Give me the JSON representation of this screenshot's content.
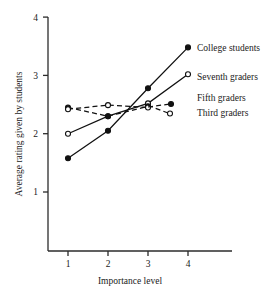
{
  "chart_data": {
    "type": "line",
    "title": "",
    "xlabel": "Importance level",
    "ylabel": "Average rating given by students",
    "x": [
      1,
      2,
      3,
      4
    ],
    "xtick_labels": [
      "1",
      "2",
      "3",
      "4"
    ],
    "ytick_labels": [
      "1",
      "2",
      "3",
      "4"
    ],
    "xlim": [
      0.55,
      4.6
    ],
    "ylim": [
      0.35,
      4.15
    ],
    "grid": false,
    "legend_position": "right-inline",
    "series": [
      {
        "name": "College students",
        "x": [
          1,
          2,
          3,
          4
        ],
        "values": [
          1.58,
          2.05,
          2.78,
          3.48
        ],
        "line_style": "solid",
        "marker": "filled-circle",
        "color": "#111111"
      },
      {
        "name": "Seventh graders",
        "x": [
          1,
          2,
          3,
          4
        ],
        "values": [
          2.0,
          2.3,
          2.52,
          3.02
        ],
        "line_style": "solid",
        "marker": "open-circle",
        "color": "#111111"
      },
      {
        "name": "Fifth graders",
        "x": [
          1,
          2,
          3
        ],
        "values": [
          2.45,
          2.3,
          2.47
        ],
        "line_style": "dashed",
        "marker": "filled-circle",
        "color": "#111111"
      },
      {
        "name": "Third graders",
        "x": [
          1,
          2,
          3
        ],
        "values": [
          2.42,
          2.49,
          2.45
        ],
        "line_style": "dashed",
        "marker": "open-circle",
        "color": "#111111"
      }
    ]
  },
  "legend": {
    "items": [
      {
        "label": "College students"
      },
      {
        "label": "Seventh graders"
      },
      {
        "label": "Fifth graders"
      },
      {
        "label": "Third graders"
      }
    ]
  },
  "axis": {
    "x_title": "Importance level",
    "y_title": "Average rating given by students",
    "x_ticks": [
      "1",
      "2",
      "3",
      "4"
    ],
    "y_ticks": [
      "1",
      "2",
      "3",
      "4"
    ]
  },
  "colors": {
    "ink": "#111111",
    "axis": "#2b2b2b",
    "background": "#ffffff"
  }
}
